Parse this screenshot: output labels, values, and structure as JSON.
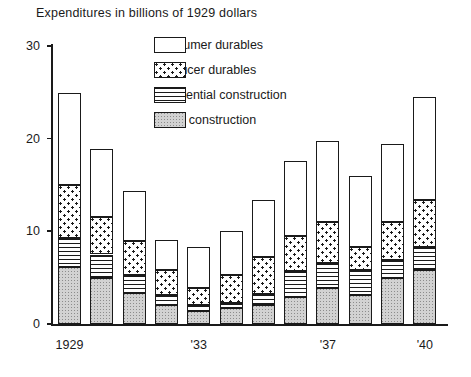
{
  "chart_data": {
    "type": "bar",
    "subtype": "stacked-bar",
    "title": "Expenditures in billions of 1929 dollars",
    "xlabel": "",
    "ylabel": "",
    "ylim": [
      0,
      30
    ],
    "yticks": [
      0,
      10,
      20,
      30
    ],
    "ytick_labels": [
      "0",
      "10",
      "20",
      "30"
    ],
    "grid": false,
    "legend_position": "upper-center",
    "categories": [
      "1929",
      "1930",
      "1931",
      "1932",
      "1933",
      "1934",
      "1935",
      "1936",
      "1937",
      "1938",
      "1939",
      "1940"
    ],
    "xtick_labels": [
      {
        "category": "1929",
        "label": "1929"
      },
      {
        "category": "1933",
        "label": "'33"
      },
      {
        "category": "1937",
        "label": "'37"
      },
      {
        "category": "1940",
        "label": "'40"
      }
    ],
    "series": [
      {
        "name": "Other construction",
        "pattern": "solid-gray-stipple",
        "values": [
          6.1,
          5.0,
          3.3,
          2.0,
          1.4,
          1.7,
          2.1,
          2.9,
          3.9,
          3.1,
          5.0,
          5.8
        ]
      },
      {
        "name": "Residential construction",
        "pattern": "horizontal-lines",
        "values": [
          3.2,
          2.5,
          2.0,
          1.1,
          0.7,
          0.6,
          1.1,
          2.8,
          2.7,
          2.7,
          1.9,
          2.5
        ]
      },
      {
        "name": "Producer durables",
        "pattern": "dotted",
        "values": [
          5.7,
          4.0,
          3.7,
          2.7,
          1.8,
          3.0,
          4.0,
          3.8,
          4.4,
          2.5,
          4.1,
          5.1
        ]
      },
      {
        "name": "Consumer durables",
        "pattern": "white",
        "values": [
          9.9,
          7.4,
          5.3,
          3.3,
          4.4,
          4.7,
          6.2,
          8.1,
          8.8,
          7.7,
          8.4,
          11.1
        ]
      }
    ],
    "totals": [
      24.9,
      18.9,
      14.3,
      9.1,
      8.3,
      10.0,
      13.4,
      17.6,
      19.8,
      16.0,
      19.4,
      24.5
    ]
  },
  "legend": {
    "items": [
      {
        "label": "Consumer durables",
        "pattern": "white"
      },
      {
        "label": "Producer durables",
        "pattern": "dotted"
      },
      {
        "label": "Residential construction",
        "pattern": "horizontal-lines"
      },
      {
        "label": "Other construction",
        "pattern": "solid-gray-stipple"
      }
    ]
  }
}
